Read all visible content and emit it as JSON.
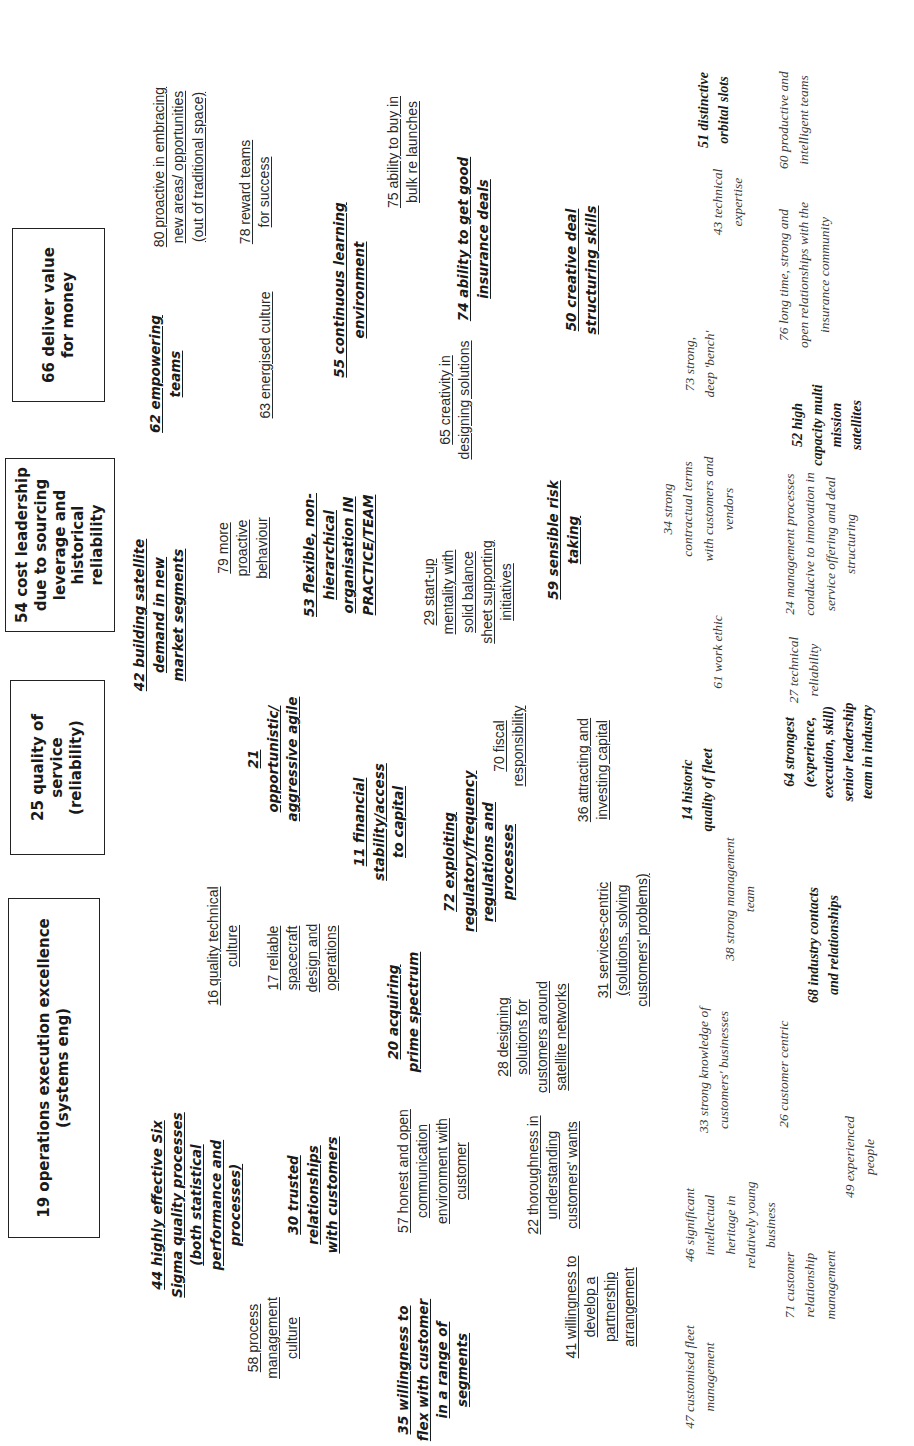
{
  "diagram": {
    "orientation": "rotated-90-ccw",
    "goal_boxes": [
      {
        "id": "19",
        "label": "19 operations execution excellence (systems eng)"
      },
      {
        "id": "25",
        "label": "25 quality of service (reliability)"
      },
      {
        "id": "54",
        "label": "54 cost leadership due to sourcing leverage and historical reliability"
      },
      {
        "id": "66",
        "label": "66 deliver value for money"
      }
    ],
    "strategic_competences": [
      {
        "id": "44",
        "label": "44 highly effective Six Sigma quality processes (both statistical performance and processes)"
      },
      {
        "id": "30",
        "label": "30 trusted relationships with customers"
      },
      {
        "id": "35",
        "label": "35 willingness to flex with customer in a range of segments"
      },
      {
        "id": "20",
        "label": "20 acquiring prime spectrum"
      },
      {
        "id": "72",
        "label": "72 exploiting regulatory/frequency regulations and processes"
      },
      {
        "id": "11",
        "label": "11 financial stability/access to capital"
      },
      {
        "id": "21",
        "label": "21 opportunistic/ aggressive agile"
      },
      {
        "id": "42",
        "label": "42 building satellite demand in new market segments"
      },
      {
        "id": "53",
        "label": "53 flexible, non-hierarchical organisation IN PRACTICE/TEAM"
      },
      {
        "id": "59",
        "label": "59 sensible risk taking"
      },
      {
        "id": "62",
        "label": "62 empowering teams"
      },
      {
        "id": "55",
        "label": "55 continuous learning environment"
      },
      {
        "id": "74",
        "label": "74 ability to get good insurance deals"
      },
      {
        "id": "50",
        "label": "50 creative deal structuring skills"
      }
    ],
    "competences": [
      {
        "id": "58",
        "label": "58 process management culture"
      },
      {
        "id": "16",
        "label": "16 quality technical culture"
      },
      {
        "id": "17",
        "label": "17 reliable spacecraft design and operations"
      },
      {
        "id": "57",
        "label": "57 honest and open communication environment with customer"
      },
      {
        "id": "41",
        "label": "41 willingness to develop a partnership arrangement"
      },
      {
        "id": "22",
        "label": "22 thoroughness in understanding customers' wants"
      },
      {
        "id": "28",
        "label": "28 designing solutions for customers around satellite networks"
      },
      {
        "id": "31",
        "label": "31 services-centric (solutions, solving customers' problems)"
      },
      {
        "id": "36",
        "label": "36 attracting and investing capital"
      },
      {
        "id": "70",
        "label": "70 fiscal responsibility"
      },
      {
        "id": "79",
        "label": "79 more proactive behaviour"
      },
      {
        "id": "29",
        "label": "29 start-up mentality with solid balance sheet supporting initiatives"
      },
      {
        "id": "65",
        "label": "65 creativity in designing solutions"
      },
      {
        "id": "63",
        "label": "63 energised culture"
      },
      {
        "id": "80",
        "label": "80 proactive in embracing new areas/ opportunities (out of traditional space)"
      },
      {
        "id": "78",
        "label": "78 reward teams for success"
      },
      {
        "id": "75",
        "label": "75 ability to buy in bulk re launches"
      }
    ],
    "assets": [
      {
        "id": "47",
        "label": "47 customised fleet management"
      },
      {
        "id": "46",
        "label": "46 significant intellectual heritage in relatively young business"
      },
      {
        "id": "71",
        "label": "71 customer relationship management"
      },
      {
        "id": "49",
        "label": "49 experienced people"
      },
      {
        "id": "33",
        "label": "33 strong knowledge of customers' businesses"
      },
      {
        "id": "26",
        "label": "26 customer centric"
      },
      {
        "id": "38",
        "label": "38 strong management team"
      },
      {
        "id": "27",
        "label": "27 technical reliability"
      },
      {
        "id": "61",
        "label": "61 work ethic"
      },
      {
        "id": "24",
        "label": "24 management processes conducive to innovation in service offering and deal structuring"
      },
      {
        "id": "34",
        "label": "34 strong contractual terms with customers and vendors"
      },
      {
        "id": "73",
        "label": "73 strong, deep 'bench'"
      },
      {
        "id": "76",
        "label": "76 long time, strong and open relationships with the insurance community"
      },
      {
        "id": "43",
        "label": "43 technical expertise"
      },
      {
        "id": "60",
        "label": "60 productive and intelligent teams"
      }
    ],
    "distinctive_assets": [
      {
        "id": "68",
        "label": "68 industry contacts and relationships"
      },
      {
        "id": "14",
        "label": "14 historic quality of fleet"
      },
      {
        "id": "64",
        "label": "64 strongest (experience, execution, skill) senior leadership team in industry"
      },
      {
        "id": "52",
        "label": "52 high capacity multi mission satellites"
      },
      {
        "id": "51",
        "label": "51 distinctive orbital slots"
      }
    ]
  }
}
